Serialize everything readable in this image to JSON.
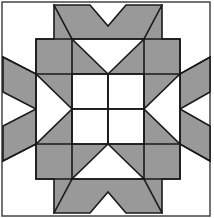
{
  "figure": {
    "kind": "geometric-quilt-block",
    "canvas": {
      "width": 214,
      "height": 218
    },
    "background_color": "#ffffff"
  },
  "palette": {
    "shaded": "#999999",
    "unshaded": "#ffffff",
    "outline": "#1a1a1a",
    "frame": "#444444",
    "background": "#ffffff"
  },
  "frame": {
    "label": "outer frame border",
    "x": 2,
    "y": 2,
    "width": 208,
    "height": 214,
    "stroke_width": 1.5
  },
  "block": {
    "label": "central four-by-four block",
    "x": 36,
    "y": 39,
    "width": 144,
    "height": 140,
    "columns": 4,
    "rows": 4,
    "cell_width": 36,
    "cell_height": 35,
    "grid_x": [
      36,
      72,
      108,
      144,
      180
    ],
    "grid_y": [
      39,
      74,
      109,
      144,
      179
    ]
  },
  "shapes": {
    "center_squares": [
      {
        "name": "center-square-top-left",
        "fill": "unshaded",
        "points": "72,74 108,74 108,109 72,109"
      },
      {
        "name": "center-square-top-right",
        "fill": "unshaded",
        "points": "108,74 144,74 144,109 108,109"
      },
      {
        "name": "center-square-bottom-left",
        "fill": "unshaded",
        "points": "72,109 108,109 108,144 72,144"
      },
      {
        "name": "center-square-bottom-right",
        "fill": "unshaded",
        "points": "108,109 144,109 144,144 108,144"
      }
    ],
    "corner_cells": [
      {
        "name": "block-corner-top-left",
        "fill": "shaded",
        "points": "36,39 72,39 72,74 36,74"
      },
      {
        "name": "block-corner-top-right",
        "fill": "shaded",
        "points": "144,39 180,39 180,74 144,74"
      },
      {
        "name": "block-corner-bottom-left",
        "fill": "shaded",
        "points": "36,144 72,144 72,179 36,179"
      },
      {
        "name": "block-corner-bottom-right",
        "fill": "shaded",
        "points": "144,144 180,144 180,179 144,179"
      }
    ],
    "star_points": [
      {
        "name": "star-point-top-left-half",
        "fill": "shaded",
        "points": "72,39 108,39 72,74"
      },
      {
        "name": "star-point-top-right-half",
        "fill": "shaded",
        "points": "144,39 144,74 108,39"
      },
      {
        "name": "star-point-top-notch",
        "fill": "unshaded",
        "points": "72,39 144,39 108,74"
      },
      {
        "name": "star-point-bottom-left-half",
        "fill": "shaded",
        "points": "72,179 72,144 108,179"
      },
      {
        "name": "star-point-bottom-right-half",
        "fill": "shaded",
        "points": "144,179 108,179 144,144"
      },
      {
        "name": "star-point-bottom-notch",
        "fill": "unshaded",
        "points": "72,179 144,179 108,144"
      },
      {
        "name": "star-point-left-top-half",
        "fill": "shaded",
        "points": "36,74 72,74 36,109"
      },
      {
        "name": "star-point-left-bottom-half",
        "fill": "shaded",
        "points": "36,144 36,109 72,144"
      },
      {
        "name": "star-point-left-notch",
        "fill": "unshaded",
        "points": "36,74 36,144 72,109"
      },
      {
        "name": "star-point-right-top-half",
        "fill": "shaded",
        "points": "180,74 180,109 144,74"
      },
      {
        "name": "star-point-right-bottom-half",
        "fill": "shaded",
        "points": "180,144 144,144 180,109"
      },
      {
        "name": "star-point-right-notch",
        "fill": "unshaded",
        "points": "180,74 180,144 144,109"
      }
    ],
    "outer_diamonds": [
      {
        "name": "outer-diamond-top-left",
        "fill": "shaded",
        "points": "36,39 72,39 54,5"
      },
      {
        "name": "outer-diamond-top-right",
        "fill": "shaded",
        "points": "144,39 180,39 162,5"
      },
      {
        "name": "outer-diamond-top-left-wing",
        "fill": "shaded",
        "points": "72,39 54,5 90,5"
      },
      {
        "name": "outer-diamond-top-right-wing",
        "fill": "shaded",
        "points": "144,39 126,5 162,5"
      },
      {
        "name": "outer-diamond-bottom-left",
        "fill": "shaded",
        "points": "36,179 72,179 54,213"
      },
      {
        "name": "outer-diamond-bottom-right",
        "fill": "shaded",
        "points": "144,179 180,179 162,213"
      },
      {
        "name": "outer-diamond-bottom-left-wing",
        "fill": "shaded",
        "points": "72,179 54,213 90,213"
      },
      {
        "name": "outer-diamond-bottom-right-wing",
        "fill": "shaded",
        "points": "144,179 126,213 162,213"
      },
      {
        "name": "outer-diamond-left-top",
        "fill": "shaded",
        "points": "36,39 36,74 3,57"
      },
      {
        "name": "outer-diamond-left-bottom",
        "fill": "shaded",
        "points": "36,144 36,179 3,161"
      },
      {
        "name": "outer-diamond-left-top-wing",
        "fill": "shaded",
        "points": "36,74 3,57 3,92"
      },
      {
        "name": "outer-diamond-left-bottom-wing",
        "fill": "shaded",
        "points": "36,144 3,126 3,161"
      },
      {
        "name": "outer-diamond-right-top",
        "fill": "shaded",
        "points": "180,39 180,74 210,57"
      },
      {
        "name": "outer-diamond-right-bottom",
        "fill": "shaded",
        "points": "180,144 180,179 210,161"
      },
      {
        "name": "outer-diamond-right-top-wing",
        "fill": "shaded",
        "points": "180,74 210,57 210,92"
      },
      {
        "name": "outer-diamond-right-bottom-wing",
        "fill": "shaded",
        "points": "180,144 210,126 210,161"
      }
    ],
    "outer_silhouette": {
      "name": "outer-octagon-silhouette",
      "fill": "shaded",
      "points": "54,5 90,5 108,26 126,5 162,5 162,39 180,39 180,74 210,57 210,92 180,109 210,126 210,161 180,144 180,179 162,179 162,213 126,213 108,192 90,213 54,213 54,179 36,179 36,144 3,161 3,126 36,109 3,92 3,57 36,74 36,39 54,39"
    },
    "outline_paths": [
      {
        "name": "grid-line-vertical-1",
        "d": "M 72 39 L 72 179"
      },
      {
        "name": "grid-line-vertical-2",
        "d": "M 108 74 L 108 144"
      },
      {
        "name": "grid-line-vertical-3",
        "d": "M 144 39 L 144 179"
      },
      {
        "name": "grid-line-horizontal-1",
        "d": "M 36 74 L 180 74"
      },
      {
        "name": "grid-line-horizontal-2",
        "d": "M 72 109 L 144 109"
      },
      {
        "name": "grid-line-horizontal-3",
        "d": "M 36 144 L 180 144"
      },
      {
        "name": "block-border",
        "d": "M 36 39 L 180 39 L 180 179 L 36 179 Z"
      }
    ]
  },
  "counts": {
    "shaded_regions": 24,
    "unshaded_regions": 10,
    "grid_cells": 16
  }
}
